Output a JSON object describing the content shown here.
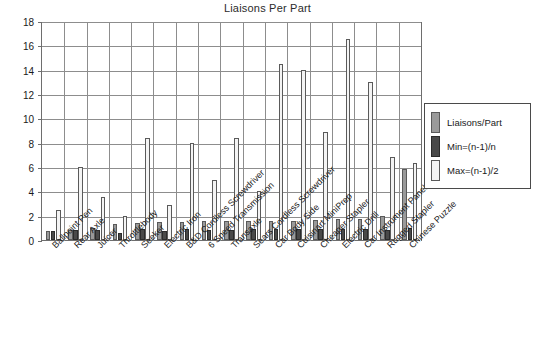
{
  "chart_data": {
    "type": "bar",
    "title": "Liaisons Per Part",
    "xlabel": "",
    "ylabel": "",
    "ylim": [
      0,
      18
    ],
    "ytick_step": 2,
    "yticks": [
      0,
      2,
      4,
      6,
      8,
      10,
      12,
      14,
      16,
      18
    ],
    "grid": true,
    "legend_position": "right-inside",
    "categories": [
      "Ballpoint Pen",
      "Rear Axle",
      "Juicer",
      "Throttlebody",
      "Seeker",
      "Electric Iron",
      "B&D Cordless Screwdriver",
      "6 Speed Transmission",
      "Transaxle",
      "Sears Cordless Screwdriver",
      "Car Body Side",
      "Cuisinart MiniPrep",
      "Cheaper Stapler",
      "Electric Drill",
      "Car Instrument Panel",
      "Rugged Stapler",
      "Chinese Puzzle"
    ],
    "series": [
      {
        "name": "Liaisons/Part",
        "color": "#9a9a9a",
        "values": [
          0.7,
          0.8,
          1.0,
          1.35,
          1.4,
          1.5,
          1.5,
          1.55,
          1.55,
          1.55,
          1.55,
          1.6,
          1.65,
          1.7,
          1.75,
          1.95,
          5.8
        ]
      },
      {
        "name": "Min=(n-1)/n",
        "color": "#494949",
        "values": [
          0.7,
          0.8,
          0.85,
          0.6,
          0.9,
          0.75,
          0.9,
          0.8,
          0.8,
          0.9,
          0.9,
          0.9,
          0.9,
          0.9,
          0.9,
          0.8,
          1.0
        ]
      },
      {
        "name": "Max=(n-1)/2",
        "color": "#f4f4f4",
        "values": [
          2.45,
          6.0,
          3.5,
          2.0,
          8.4,
          2.9,
          8.0,
          4.95,
          8.4,
          4.05,
          14.5,
          14.0,
          8.9,
          16.5,
          13.0,
          6.85,
          6.3
        ]
      }
    ]
  },
  "legend": {
    "items": [
      {
        "label": "Liaisons/Part"
      },
      {
        "label": "Min=(n-1)/n"
      },
      {
        "label": "Max=(n-1)/2"
      }
    ]
  }
}
